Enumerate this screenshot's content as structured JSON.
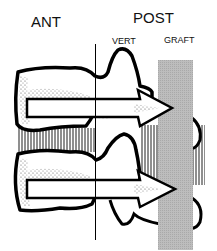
{
  "labels": {
    "ant": "ANT",
    "post": "POST",
    "vert": "VERT",
    "graft": "GRAFT"
  },
  "colors": {
    "outline": "#000000",
    "graft_fill": "#b8b8b8",
    "stipple": "#555555",
    "hatch": "#444444",
    "background": "#ffffff"
  },
  "structures": {
    "vertebrae": [
      "upper-vertebra",
      "lower-vertebra"
    ],
    "disc": "intervertebral-disc",
    "graft": "posterior-graft",
    "arrows": [
      "upper-arrow",
      "lower-arrow"
    ],
    "reference_line": "vertical-reference-line"
  }
}
